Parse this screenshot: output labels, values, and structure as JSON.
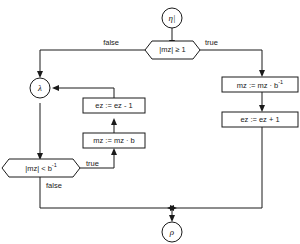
{
  "diagram": {
    "type": "flowchart",
    "stroke_color": "#1a1a1a",
    "background_color": "#ffffff",
    "nodes": [
      {
        "id": "entry",
        "shape": "circle",
        "label": "η|",
        "role": "entry-connector"
      },
      {
        "id": "decision-top",
        "shape": "hexagon",
        "label": "|mz| ≥ 1",
        "role": "decision"
      },
      {
        "id": "lambda",
        "shape": "circle",
        "label": "λ",
        "role": "junction-connector"
      },
      {
        "id": "box-mz-div",
        "shape": "rect",
        "label": "mz := mz · b",
        "superscript": "-1",
        "role": "process"
      },
      {
        "id": "box-ez-inc",
        "shape": "rect",
        "label": "ez := ez + 1",
        "role": "process"
      },
      {
        "id": "box-ez-dec",
        "shape": "rect",
        "label": "ez := ez - 1",
        "role": "process"
      },
      {
        "id": "box-mz-mul",
        "shape": "rect",
        "label": "mz := mz · b",
        "role": "process"
      },
      {
        "id": "decision-bottom",
        "shape": "hexagon",
        "label": "|mz| < b",
        "superscript": "-1",
        "role": "decision"
      },
      {
        "id": "exit",
        "shape": "circle",
        "label": "ρ",
        "role": "exit-connector"
      }
    ],
    "edge_labels": {
      "top_false": "false",
      "top_true": "true",
      "bottom_true": "true",
      "bottom_false": "false"
    }
  }
}
